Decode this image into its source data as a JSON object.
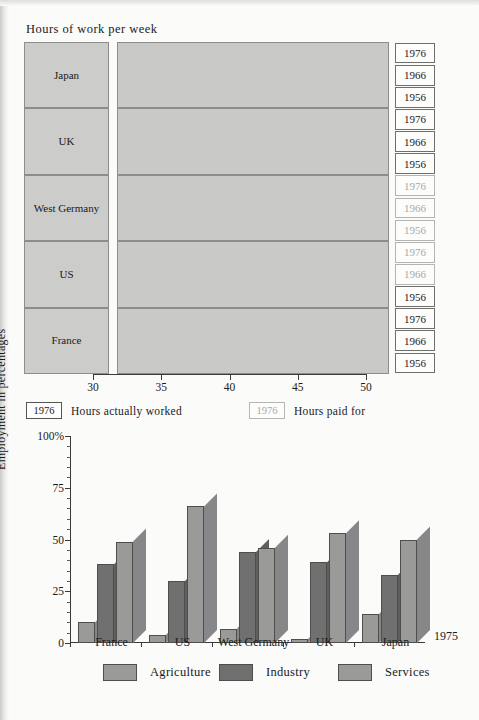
{
  "top": {
    "title": "Hours of work per week",
    "axis": {
      "min": 30,
      "max": 50,
      "ticks": [
        30,
        35,
        40,
        45,
        50
      ]
    },
    "years": [
      "1976",
      "1966",
      "1956"
    ],
    "legend": [
      {
        "box": "1976",
        "label": "Hours actually worked",
        "muted": false
      },
      {
        "box": "1976",
        "label": "Hours paid for",
        "muted": true
      }
    ],
    "groups": [
      {
        "country": "Japan",
        "rows": [
          {
            "year": "1976",
            "worked": 40.4,
            "paid": 47.6,
            "muted": false
          },
          {
            "year": "1966",
            "worked": 44.1,
            "paid": 47.6,
            "muted": false
          },
          {
            "year": "1956",
            "worked": 45.2,
            "paid": 47.6,
            "muted": false
          }
        ]
      },
      {
        "country": "UK",
        "rows": [
          {
            "year": "1976",
            "worked": 40.2,
            "paid": 47.6,
            "muted": false
          },
          {
            "year": "1966",
            "worked": 42.3,
            "paid": 47.6,
            "muted": false
          },
          {
            "year": "1956",
            "worked": 45.3,
            "paid": 47.6,
            "muted": false
          }
        ]
      },
      {
        "country": "West Germany",
        "rows": [
          {
            "year": "1976",
            "worked": 41.9,
            "paid": 47.6,
            "muted": true
          },
          {
            "year": "1966",
            "worked": 43.9,
            "paid": 47.6,
            "muted": true
          },
          {
            "year": "1956",
            "worked": 48.2,
            "paid": 47.6,
            "muted": true
          }
        ]
      },
      {
        "country": "US",
        "rows": [
          {
            "year": "1976",
            "worked": 36.0,
            "paid": 47.6,
            "muted": true
          },
          {
            "year": "1966",
            "worked": 39.5,
            "paid": 47.6,
            "muted": true
          },
          {
            "year": "1956",
            "worked": 41.0,
            "paid": 47.6,
            "muted": false
          }
        ]
      },
      {
        "country": "France",
        "rows": [
          {
            "year": "1976",
            "worked": 42.5,
            "paid": 47.6,
            "muted": false
          },
          {
            "year": "1966",
            "worked": 46.3,
            "paid": 47.6,
            "muted": false
          },
          {
            "year": "1956",
            "worked": 46.1,
            "paid": 47.6,
            "muted": false
          }
        ]
      }
    ]
  },
  "bottom": {
    "year_note": "1975",
    "ylabel": "Employment in percentages",
    "ytop_label": "100%",
    "yticks": [
      0,
      25,
      50,
      75,
      100
    ],
    "countries": [
      "France",
      "US",
      "West Germany",
      "UK",
      "Japan"
    ],
    "legend": [
      {
        "label": "Agriculture",
        "key": "ag"
      },
      {
        "label": "Industry",
        "key": "in"
      },
      {
        "label": "Services",
        "key": "sv"
      }
    ]
  },
  "chart_data": [
    {
      "type": "bar",
      "orientation": "horizontal",
      "title": "Hours of work per week",
      "xlabel": "",
      "ylabel": "",
      "xlim": [
        30,
        50
      ],
      "xticks": [
        30,
        35,
        40,
        45,
        50
      ],
      "grid": false,
      "legend": [
        "Hours actually worked",
        "Hours paid for"
      ],
      "legend_position": "below",
      "categories": [
        "Japan",
        "UK",
        "West Germany",
        "US",
        "France"
      ],
      "subcategories": [
        "1976",
        "1966",
        "1956"
      ],
      "series": [
        {
          "name": "Hours actually worked",
          "values": {
            "Japan": [
              40.4,
              44.1,
              45.2
            ],
            "UK": [
              40.2,
              42.3,
              45.3
            ],
            "West Germany": [
              41.9,
              43.9,
              48.2
            ],
            "US": [
              36.0,
              39.5,
              41.0
            ],
            "France": [
              42.5,
              46.3,
              46.1
            ]
          }
        },
        {
          "name": "Hours paid for",
          "values": {
            "Japan": [
              47.6,
              47.6,
              47.6
            ],
            "UK": [
              47.6,
              47.6,
              47.6
            ],
            "West Germany": [
              47.6,
              47.6,
              47.6
            ],
            "US": [
              47.6,
              47.6,
              47.6
            ],
            "France": [
              47.6,
              47.6,
              47.6
            ]
          }
        }
      ]
    },
    {
      "type": "bar",
      "orientation": "vertical",
      "title": "",
      "xlabel": "",
      "ylabel": "Employment in percentages",
      "ylim": [
        0,
        100
      ],
      "yticks": [
        0,
        25,
        50,
        75,
        100
      ],
      "annotation": "1975",
      "grid": false,
      "legend_position": "below",
      "categories": [
        "France",
        "US",
        "West Germany",
        "UK",
        "Japan"
      ],
      "series": [
        {
          "name": "Agriculture",
          "values": [
            10,
            4,
            7,
            2,
            14
          ]
        },
        {
          "name": "Industry",
          "values": [
            38,
            30,
            44,
            39,
            33
          ]
        },
        {
          "name": "Services",
          "values": [
            49,
            66,
            46,
            53,
            50
          ]
        }
      ]
    }
  ]
}
